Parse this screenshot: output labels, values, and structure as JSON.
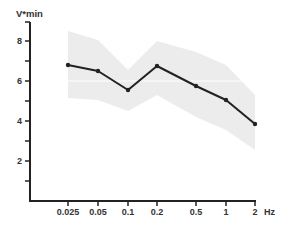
{
  "chart_data": {
    "type": "line",
    "title": "",
    "xlabel": "Hz",
    "ylabel": "V*min",
    "categories": [
      "0.025",
      "0.05",
      "0.1",
      "0.2",
      "0.5",
      "1",
      "2"
    ],
    "x_scale": "log (categorical spacing)",
    "series": [
      {
        "name": "mean",
        "values": [
          6.8,
          6.5,
          5.55,
          6.75,
          5.75,
          5.05,
          3.85
        ],
        "color": "#222222",
        "marker": "circle"
      }
    ],
    "band": {
      "name": "range",
      "upper": [
        8.5,
        8.05,
        6.55,
        8.0,
        7.45,
        6.8,
        5.3
      ],
      "lower": [
        5.15,
        5.05,
        4.5,
        5.3,
        4.2,
        3.55,
        2.55
      ],
      "color": "#ececec"
    },
    "ylim": [
      0,
      9
    ],
    "yticks_major": [
      2,
      4,
      6,
      8
    ],
    "yticks_minor": [
      1,
      3,
      5,
      7
    ],
    "gridline_y": [
      6
    ],
    "grid": false,
    "legend": null
  },
  "axes": {
    "y_title": "V*min",
    "x_unit": "Hz",
    "y_tick_labels": [
      "2",
      "4",
      "6",
      "8"
    ],
    "x_tick_labels": [
      "0.025",
      "0.05",
      "0.1",
      "0.2",
      "0.5",
      "1",
      "2"
    ]
  }
}
